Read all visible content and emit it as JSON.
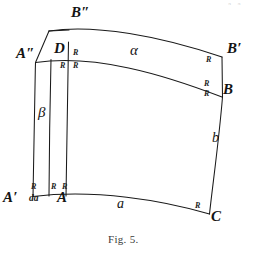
{
  "figure": {
    "caption": "Fig. 5.",
    "page_artifact": "a. a",
    "stroke_color": "#1a1a1a",
    "background_color": "#ffffff",
    "vertices": [
      {
        "id": "A2",
        "label": "A″",
        "x": 18,
        "y": 53
      },
      {
        "id": "B2",
        "label": "B″",
        "x": 73,
        "y": 12
      },
      {
        "id": "Bp",
        "label": "B′",
        "x": 228,
        "y": 48
      },
      {
        "id": "B",
        "label": "B",
        "x": 224,
        "y": 89
      },
      {
        "id": "D",
        "label": "D",
        "x": 55,
        "y": 47
      },
      {
        "id": "Ap",
        "label": "A′",
        "x": 4,
        "y": 196
      },
      {
        "id": "A",
        "label": "A",
        "x": 59,
        "y": 196
      },
      {
        "id": "C",
        "label": "C",
        "x": 213,
        "y": 215
      }
    ],
    "arc_labels": [
      {
        "id": "alpha",
        "label": "α",
        "x": 132,
        "y": 49,
        "kind": "greek"
      },
      {
        "id": "beta",
        "label": "β",
        "x": 40,
        "y": 112,
        "kind": "greek"
      },
      {
        "id": "a",
        "label": "a",
        "x": 118,
        "y": 203,
        "kind": "latin"
      },
      {
        "id": "b",
        "label": "b",
        "x": 213,
        "y": 137,
        "kind": "latin"
      }
    ],
    "right_angle_markers": [
      {
        "id": "r-d-right",
        "label": "R",
        "x": 74,
        "y": 50
      },
      {
        "id": "r-d-below-l",
        "label": "R",
        "x": 62,
        "y": 62
      },
      {
        "id": "r-d-below-r",
        "label": "R",
        "x": 74,
        "y": 62
      },
      {
        "id": "r-bprime",
        "label": "R",
        "x": 207,
        "y": 57
      },
      {
        "id": "r-b-above",
        "label": "R",
        "x": 205,
        "y": 81
      },
      {
        "id": "r-b-below",
        "label": "R",
        "x": 205,
        "y": 91
      },
      {
        "id": "r-aprime",
        "label": "R",
        "x": 33,
        "y": 184
      },
      {
        "id": "r-a-left",
        "label": "R",
        "x": 54,
        "y": 184
      },
      {
        "id": "r-a-right",
        "label": "R",
        "x": 64,
        "y": 184
      },
      {
        "id": "r-c",
        "label": "R",
        "x": 196,
        "y": 203
      }
    ],
    "differential_labels": [
      {
        "id": "da",
        "label": "da",
        "x": 30,
        "y": 198
      }
    ],
    "curve_paths": {
      "outer_top_B2_to_Bprime": "M 49,31 C 100,25 170,39 222,57",
      "mid_top_A2_to_B": "M 36,62 C 100,54 170,76 222,97",
      "bottom_Aprime_to_C": "M 33,196 C 100,190 165,200 209,214",
      "left_outer_A2_to_Aprime": "M 36,62 C 34,110 33,155 33,196",
      "left_inner_D_to_A": "M 51,59 C 49,110 49,158 49,196",
      "inner_vertical_d_to_A": "M 68,41 C 66,110 66,160 66,196",
      "top_left_edge_A2_to_B2top": "M 36,62 L 49,31",
      "right_edge_Bprime_to_B": "M 222,57 L 222,97",
      "right_edge_B_to_C": "M 222,97 C 218,140 213,180 209,214",
      "top_bar_left": "M 49,31 L 80,28"
    }
  }
}
